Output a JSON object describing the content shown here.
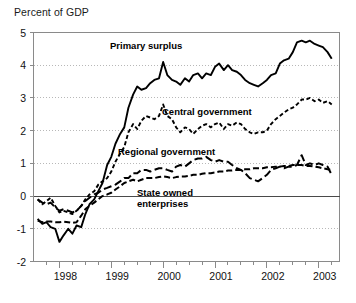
{
  "chart_data": {
    "type": "line",
    "title": "Percent of GDP",
    "xlabel": "",
    "ylabel": "",
    "ylim": [
      -2,
      5
    ],
    "xlim": [
      1997.5,
      2003.4
    ],
    "grid": "horizontal-dotted",
    "zero_line": true,
    "legend_position": "inline-annotations",
    "yticks": [
      5,
      4,
      3,
      2,
      1,
      0,
      -1,
      -2
    ],
    "ytick_labels": [
      "5",
      "4",
      "3",
      "2",
      "1",
      "0",
      "-1",
      "-2"
    ],
    "xticks": [
      1998,
      1999,
      2000,
      2001,
      2002,
      2003
    ],
    "xtick_labels": [
      "1998",
      "1999",
      "2000",
      "2001",
      "2002",
      "2003"
    ],
    "x_minor_tick_interval": 0.25,
    "annotations": [
      {
        "text": "Primary surplus",
        "series": "Primary surplus"
      },
      {
        "text": "Central government",
        "series": "Central government"
      },
      {
        "text": "Regional government",
        "series": "Regional government"
      },
      {
        "text": "State owned enterprises",
        "series": "State owned enterprises"
      }
    ],
    "x": [
      1997.58,
      1997.67,
      1997.75,
      1997.83,
      1997.92,
      1998.0,
      1998.08,
      1998.17,
      1998.25,
      1998.33,
      1998.42,
      1998.5,
      1998.58,
      1998.67,
      1998.75,
      1998.83,
      1998.92,
      1999.0,
      1999.08,
      1999.17,
      1999.25,
      1999.33,
      1999.42,
      1999.5,
      1999.58,
      1999.67,
      1999.75,
      1999.83,
      1999.92,
      2000.0,
      2000.08,
      2000.17,
      2000.25,
      2000.33,
      2000.42,
      2000.5,
      2000.58,
      2000.67,
      2000.75,
      2000.83,
      2000.92,
      2001.0,
      2001.08,
      2001.17,
      2001.25,
      2001.33,
      2001.42,
      2001.5,
      2001.58,
      2001.67,
      2001.75,
      2001.83,
      2001.92,
      2002.0,
      2002.08,
      2002.17,
      2002.25,
      2002.33,
      2002.42,
      2002.5,
      2002.58,
      2002.67,
      2002.75,
      2002.83,
      2002.92,
      2003.0,
      2003.08,
      2003.17,
      2003.25
    ],
    "series": [
      {
        "name": "Primary surplus",
        "style": "solid",
        "color": "#000000",
        "values": [
          -0.7,
          -0.85,
          -0.8,
          -0.95,
          -1.0,
          -1.4,
          -1.2,
          -1.0,
          -1.15,
          -0.9,
          -0.95,
          -0.55,
          -0.25,
          -0.1,
          0.15,
          0.4,
          0.95,
          1.2,
          1.6,
          1.9,
          2.1,
          2.7,
          3.1,
          3.35,
          3.25,
          3.3,
          3.45,
          3.55,
          3.6,
          4.1,
          3.7,
          3.55,
          3.5,
          3.4,
          3.6,
          3.5,
          3.7,
          3.75,
          3.6,
          3.75,
          3.7,
          3.95,
          4.05,
          3.85,
          4.0,
          3.85,
          3.8,
          3.7,
          3.55,
          3.45,
          3.4,
          3.35,
          3.45,
          3.55,
          3.7,
          3.75,
          4.05,
          4.15,
          4.2,
          4.4,
          4.7,
          4.75,
          4.7,
          4.75,
          4.65,
          4.6,
          4.55,
          4.4,
          4.2
        ]
      },
      {
        "name": "Central government",
        "style": "dashed-short",
        "color": "#000000",
        "values": [
          -0.1,
          -0.25,
          -0.15,
          -0.05,
          -0.3,
          -0.5,
          -0.45,
          -0.5,
          -0.55,
          -0.45,
          -0.3,
          -0.1,
          0.05,
          0.15,
          0.35,
          0.45,
          0.55,
          0.75,
          1.05,
          1.3,
          1.5,
          1.95,
          2.2,
          2.05,
          2.3,
          2.45,
          2.4,
          2.35,
          2.45,
          2.8,
          2.45,
          2.35,
          2.1,
          1.95,
          2.1,
          2.05,
          1.9,
          2.05,
          2.15,
          2.2,
          2.1,
          2.2,
          2.25,
          2.05,
          2.2,
          2.15,
          2.25,
          2.2,
          2.05,
          1.95,
          1.9,
          1.95,
          1.95,
          2.0,
          2.2,
          2.35,
          2.45,
          2.55,
          2.65,
          2.7,
          2.8,
          2.95,
          2.95,
          3.0,
          2.9,
          2.95,
          2.85,
          2.9,
          2.8
        ]
      },
      {
        "name": "Regional government",
        "style": "dashed-long",
        "color": "#000000",
        "values": [
          -0.1,
          -0.2,
          -0.25,
          -0.2,
          -0.35,
          -0.45,
          -0.4,
          -0.45,
          -0.5,
          -0.45,
          -0.3,
          -0.15,
          -0.05,
          0.05,
          0.1,
          0.2,
          0.25,
          0.3,
          0.35,
          0.45,
          0.55,
          0.55,
          0.7,
          0.7,
          0.8,
          0.8,
          0.75,
          0.8,
          0.85,
          0.85,
          0.8,
          0.75,
          0.9,
          0.95,
          0.9,
          1.0,
          1.1,
          1.15,
          1.15,
          1.2,
          1.1,
          1.05,
          1.1,
          1.05,
          1.05,
          0.95,
          0.85,
          0.8,
          0.7,
          0.55,
          0.5,
          0.45,
          0.55,
          0.65,
          0.8,
          0.85,
          0.9,
          0.85,
          0.9,
          0.9,
          0.95,
          1.25,
          0.95,
          1.0,
          0.95,
          1.0,
          0.95,
          0.9,
          0.65
        ]
      },
      {
        "name": "State owned enterprises",
        "style": "dashed-medium",
        "color": "#000000",
        "values": [
          -0.75,
          -0.8,
          -0.78,
          -0.78,
          -0.8,
          -0.8,
          -0.78,
          -0.8,
          -0.82,
          -0.8,
          -0.6,
          -0.4,
          -0.3,
          -0.2,
          -0.1,
          0.0,
          0.05,
          0.1,
          0.2,
          0.3,
          0.4,
          0.45,
          0.5,
          0.45,
          0.5,
          0.55,
          0.55,
          0.55,
          0.58,
          0.6,
          0.58,
          0.55,
          0.58,
          0.6,
          0.6,
          0.62,
          0.65,
          0.65,
          0.68,
          0.7,
          0.7,
          0.72,
          0.75,
          0.75,
          0.78,
          0.78,
          0.8,
          0.8,
          0.82,
          0.82,
          0.85,
          0.85,
          0.85,
          0.88,
          0.88,
          0.9,
          0.9,
          0.92,
          0.92,
          0.95,
          0.95,
          0.95,
          0.92,
          0.92,
          0.9,
          0.88,
          0.85,
          0.82,
          0.8
        ]
      }
    ]
  },
  "colors": {
    "line": "#000000",
    "grid": "#9a9a9a",
    "axis": "#8a8a8a",
    "text": "#111111"
  }
}
